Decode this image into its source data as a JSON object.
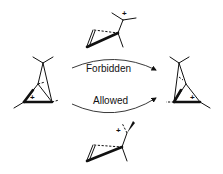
{
  "diagram": {
    "top_arrow_label": "Forbidden",
    "bottom_arrow_label": "Allowed",
    "charge_symbol": "+"
  },
  "structures": [
    {
      "id": "left-bicyclobutonium",
      "position": "left",
      "charge": "+"
    },
    {
      "id": "right-bicyclobutonium",
      "position": "right",
      "charge": "+"
    },
    {
      "id": "top-transition-state",
      "position": "top",
      "charge": "+",
      "label": "Forbidden pathway intermediate"
    },
    {
      "id": "bottom-transition-state",
      "position": "bottom",
      "charge": "+",
      "label": "Allowed pathway intermediate"
    }
  ],
  "colors": {
    "ink": "#111111",
    "background": "#ffffff"
  }
}
